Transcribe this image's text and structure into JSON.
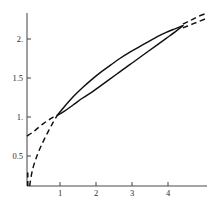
{
  "figure": {
    "title": "",
    "background_color": "#ffffff",
    "axis_color": "#4a4a4a",
    "curve_color": "#101010"
  },
  "axes": {
    "x_ticks": [
      "1",
      "2",
      "3",
      "4"
    ],
    "y_ticks": [
      "0.5",
      "1.",
      "1.5",
      "2."
    ],
    "xlabel": "",
    "ylabel": ""
  },
  "chart_data": {
    "type": "line",
    "title": "",
    "xlabel": "",
    "ylabel": "",
    "xlim": [
      0,
      4.85
    ],
    "ylim": [
      0,
      2.32
    ],
    "xticks": [
      1,
      2,
      3,
      4
    ],
    "xticklabels": [
      "1",
      "2",
      "3",
      "4"
    ],
    "yticks": [
      0.5,
      1.0,
      1.5,
      2.0
    ],
    "yticklabels": [
      "0.5",
      "1.",
      "1.5",
      "2."
    ],
    "grid": false,
    "legend": null,
    "legend_position": "none",
    "annotations": [],
    "series": [
      {
        "name": "upper-curve-solid",
        "style": "solid",
        "comment": "concave increasing branch, upper edge of lens",
        "x": [
          0.82,
          1.0,
          1.25,
          1.5,
          1.75,
          2.0,
          2.25,
          2.5,
          2.75,
          3.0,
          3.25,
          3.5,
          3.75,
          4.0,
          4.2
        ],
        "y": [
          0.95,
          1.06,
          1.2,
          1.32,
          1.43,
          1.53,
          1.62,
          1.71,
          1.79,
          1.86,
          1.93,
          2.0,
          2.06,
          2.11,
          2.15
        ]
      },
      {
        "name": "lower-curve-solid",
        "style": "solid",
        "comment": "near-straight chord, lower edge of lens",
        "x": [
          0.82,
          1.0,
          1.25,
          1.5,
          1.75,
          2.0,
          2.25,
          2.5,
          2.75,
          3.0,
          3.25,
          3.5,
          3.75,
          4.0,
          4.2
        ],
        "y": [
          0.95,
          1.0,
          1.09,
          1.18,
          1.26,
          1.35,
          1.44,
          1.53,
          1.62,
          1.71,
          1.8,
          1.89,
          1.98,
          2.07,
          2.15
        ]
      },
      {
        "name": "upper-curve-dashed-right",
        "style": "dashed",
        "comment": "extrapolation of upper branch past x=4.2",
        "x": [
          4.2,
          4.4,
          4.6,
          4.8
        ],
        "y": [
          2.17,
          2.22,
          2.27,
          2.31
        ]
      },
      {
        "name": "lower-curve-dashed-right",
        "style": "dashed",
        "comment": "extrapolation of lower branch past x=4.2",
        "x": [
          4.2,
          4.4,
          4.6,
          4.8
        ],
        "y": [
          2.12,
          2.16,
          2.2,
          2.24
        ]
      },
      {
        "name": "upper-curve-dashed-left",
        "style": "dashed",
        "comment": "left branch descending from y-axis intercept near 0.67",
        "x": [
          0.0,
          0.15,
          0.3,
          0.45,
          0.6,
          0.72,
          0.82
        ],
        "y": [
          0.67,
          0.72,
          0.78,
          0.84,
          0.89,
          0.93,
          0.95
        ]
      },
      {
        "name": "lower-curve-dashed-left",
        "style": "dashed",
        "comment": "steep left branch rising from near the origin",
        "x": [
          0.07,
          0.15,
          0.28,
          0.42,
          0.56,
          0.7,
          0.82
        ],
        "y": [
          0.0,
          0.22,
          0.42,
          0.58,
          0.72,
          0.85,
          0.95
        ]
      },
      {
        "name": "axis-stub-vertical",
        "style": "solid",
        "comment": "short thick segment hugging the y-axis just above the origin",
        "x": [
          0.02,
          0.02
        ],
        "y": [
          0.0,
          0.18
        ]
      }
    ]
  }
}
